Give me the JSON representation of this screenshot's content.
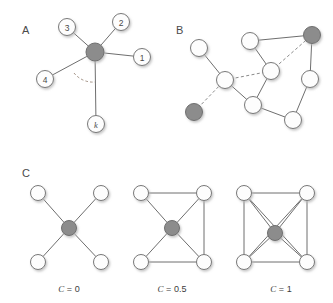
{
  "figure": {
    "background": "#ffffff",
    "colors": {
      "node_fill_white": "#fdfdfd",
      "node_fill_gray": "#8c8c8c",
      "node_stroke": "#767676",
      "edge_solid": "#6e6e6e",
      "edge_dashed": "#8a8a8a",
      "text": "#4a4a4a",
      "shadow": "#c9c9c9"
    },
    "panels": [
      {
        "id": "A",
        "letter": "A",
        "name": "node-degree-star",
        "hub": {
          "cx": 95,
          "cy": 52,
          "r": 9,
          "fill": "gray"
        },
        "nodes": [
          {
            "label": "1",
            "cx": 142,
            "cy": 57,
            "r": 8.5,
            "italic": false
          },
          {
            "label": "2",
            "cx": 121,
            "cy": 22,
            "r": 8.5,
            "italic": false
          },
          {
            "label": "3",
            "cx": 67,
            "cy": 27,
            "r": 8.5,
            "italic": false
          },
          {
            "label": "4",
            "cx": 45,
            "cy": 79,
            "r": 8.5,
            "italic": false
          },
          {
            "label": "k",
            "cx": 96,
            "cy": 124,
            "r": 8.5,
            "italic": true
          }
        ],
        "angle_arc": true
      },
      {
        "id": "B",
        "letter": "B",
        "name": "mixed-edge-network",
        "nodes": [
          {
            "idx": 0,
            "cx": 199,
            "cy": 48,
            "r": 8.5,
            "fill": "white"
          },
          {
            "idx": 1,
            "cx": 250,
            "cy": 41,
            "r": 8.5,
            "fill": "white"
          },
          {
            "idx": 2,
            "cx": 312,
            "cy": 35,
            "r": 8.5,
            "fill": "gray"
          },
          {
            "idx": 3,
            "cx": 271,
            "cy": 71,
            "r": 8.5,
            "fill": "white"
          },
          {
            "idx": 4,
            "cx": 310,
            "cy": 79,
            "r": 8.5,
            "fill": "white"
          },
          {
            "idx": 5,
            "cx": 225,
            "cy": 80,
            "r": 8.5,
            "fill": "white"
          },
          {
            "idx": 6,
            "cx": 194,
            "cy": 112,
            "r": 8.5,
            "fill": "gray"
          },
          {
            "idx": 7,
            "cx": 253,
            "cy": 105,
            "r": 8.5,
            "fill": "white"
          },
          {
            "idx": 8,
            "cx": 293,
            "cy": 120,
            "r": 8.5,
            "fill": "white"
          }
        ],
        "edges_solid": [
          [
            0,
            5
          ],
          [
            1,
            2
          ],
          [
            1,
            3
          ],
          [
            2,
            4
          ],
          [
            5,
            7
          ],
          [
            7,
            8
          ],
          [
            4,
            8
          ],
          [
            2,
            3
          ]
        ],
        "edges_dashed": [
          [
            5,
            3
          ],
          [
            6,
            5
          ],
          [
            2,
            3
          ],
          [
            5,
            7
          ]
        ]
      },
      {
        "id": "C",
        "letter": "C",
        "name": "clustering-coefficient-examples",
        "subfigures": [
          {
            "caption_var": "C",
            "caption_value": "0",
            "name": "clustering-c0",
            "center": {
              "cx": 69,
              "cy": 228,
              "r": 7.5
            },
            "corners": [
              {
                "cx": 38,
                "cy": 193
              },
              {
                "cx": 101,
                "cy": 193
              },
              {
                "cx": 38,
                "cy": 262
              },
              {
                "cx": 101,
                "cy": 262
              }
            ],
            "perimeter_edges": []
          },
          {
            "caption_var": "C",
            "caption_value": "0.5",
            "name": "clustering-c05",
            "center": {
              "cx": 172,
              "cy": 228,
              "r": 7.5
            },
            "corners": [
              {
                "cx": 141,
                "cy": 193
              },
              {
                "cx": 204,
                "cy": 193
              },
              {
                "cx": 141,
                "cy": 262
              },
              {
                "cx": 204,
                "cy": 262
              }
            ],
            "perimeter_edges": [
              [
                0,
                1
              ],
              [
                1,
                3
              ],
              [
                2,
                3
              ]
            ]
          },
          {
            "caption_var": "C",
            "caption_value": "1",
            "name": "clustering-c1",
            "center": {
              "cx": 275,
              "cy": 233,
              "r": 7.5
            },
            "corners": [
              {
                "cx": 244,
                "cy": 193
              },
              {
                "cx": 307,
                "cy": 193
              },
              {
                "cx": 244,
                "cy": 262
              },
              {
                "cx": 307,
                "cy": 262
              }
            ],
            "perimeter_edges": [
              [
                0,
                1
              ],
              [
                1,
                3
              ],
              [
                2,
                3
              ],
              [
                0,
                2
              ],
              [
                0,
                3
              ],
              [
                1,
                2
              ]
            ]
          }
        ]
      }
    ]
  }
}
